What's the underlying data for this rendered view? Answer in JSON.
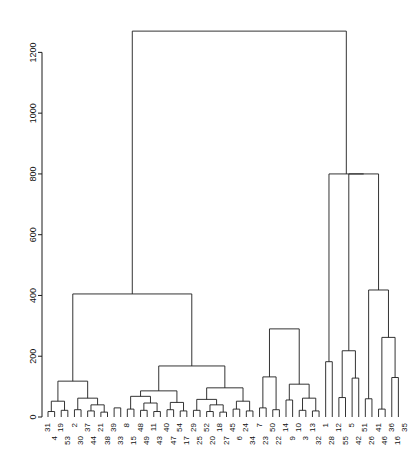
{
  "chart_data": {
    "type": "dendrogram",
    "title": "",
    "subtitle": "",
    "xlabel": "",
    "ylabel": "",
    "ylim": [
      0,
      1300
    ],
    "yticks": [
      0,
      200,
      400,
      600,
      800,
      1000,
      1200
    ],
    "ytick_labels": [
      "0",
      "200",
      "400",
      "600",
      "800",
      "1000",
      "1200"
    ],
    "grid": false,
    "legend": "none",
    "axis_side": "left",
    "leaf_label_rotation": -90,
    "leaf_label_stagger": true,
    "n_leaves": 55,
    "leaf_labels": [
      "31",
      "4",
      "19",
      "53",
      "2",
      "30",
      "37",
      "44",
      "21",
      "38",
      "39",
      "33",
      "8",
      "15",
      "48",
      "49",
      "11",
      "43",
      "40",
      "47",
      "54",
      "17",
      "29",
      "25",
      "52",
      "20",
      "18",
      "27",
      "45",
      "6",
      "24",
      "34",
      "7",
      "23",
      "50",
      "22",
      "14",
      "9",
      "10",
      "3",
      "13",
      "32",
      "1",
      "28",
      "12",
      "55",
      "5",
      "42",
      "51",
      "26",
      "41",
      "46",
      "36",
      "16",
      "35"
    ],
    "merges": [
      {
        "id": "m1",
        "left": "31",
        "right": "4",
        "height": 18
      },
      {
        "id": "m2",
        "left": "19",
        "right": "53",
        "height": 22
      },
      {
        "id": "m3",
        "left": "m1",
        "right": "m2",
        "height": 52
      },
      {
        "id": "m4",
        "left": "2",
        "right": "30",
        "height": 24
      },
      {
        "id": "m5",
        "left": "37",
        "right": "44",
        "height": 20
      },
      {
        "id": "m6",
        "left": "21",
        "right": "38",
        "height": 16
      },
      {
        "id": "m7",
        "left": "m5",
        "right": "m6",
        "height": 40
      },
      {
        "id": "m8",
        "left": "m4",
        "right": "m7",
        "height": 62
      },
      {
        "id": "m9",
        "left": "m3",
        "right": "m8",
        "height": 118
      },
      {
        "id": "m10",
        "left": "39",
        "right": "33",
        "height": 30
      },
      {
        "id": "m11",
        "left": "8",
        "right": "15",
        "height": 26
      },
      {
        "id": "m12",
        "left": "48",
        "right": "49",
        "height": 22
      },
      {
        "id": "m13",
        "left": "11",
        "right": "43",
        "height": 18
      },
      {
        "id": "m14",
        "left": "m12",
        "right": "m13",
        "height": 46
      },
      {
        "id": "m15",
        "left": "m11",
        "right": "m14",
        "height": 68
      },
      {
        "id": "m16",
        "left": "40",
        "right": "47",
        "height": 24
      },
      {
        "id": "m17",
        "left": "54",
        "right": "17",
        "height": 20
      },
      {
        "id": "m18",
        "left": "m16",
        "right": "m17",
        "height": 48
      },
      {
        "id": "m19",
        "left": "m15",
        "right": "m18",
        "height": 86
      },
      {
        "id": "m20",
        "left": "29",
        "right": "25",
        "height": 22
      },
      {
        "id": "m21",
        "left": "52",
        "right": "20",
        "height": 18
      },
      {
        "id": "m22",
        "left": "18",
        "right": "27",
        "height": 16
      },
      {
        "id": "m23",
        "left": "m21",
        "right": "m22",
        "height": 40
      },
      {
        "id": "m24",
        "left": "m20",
        "right": "m23",
        "height": 58
      },
      {
        "id": "m25",
        "left": "45",
        "right": "6",
        "height": 26
      },
      {
        "id": "m26",
        "left": "24",
        "right": "34",
        "height": 20
      },
      {
        "id": "m27",
        "left": "m25",
        "right": "m26",
        "height": 52
      },
      {
        "id": "m28",
        "left": "m24",
        "right": "m27",
        "height": 96
      },
      {
        "id": "m29",
        "left": "m19",
        "right": "m28",
        "height": 168
      },
      {
        "id": "m30",
        "left": "m9",
        "right": "m29",
        "height": 405
      },
      {
        "id": "m31",
        "left": "7",
        "right": "23",
        "height": 30
      },
      {
        "id": "m32",
        "left": "50",
        "right": "22",
        "height": 24
      },
      {
        "id": "m33",
        "left": "m31",
        "right": "m32",
        "height": 132
      },
      {
        "id": "m34",
        "left": "14",
        "right": "9",
        "height": 56
      },
      {
        "id": "m35",
        "left": "10",
        "right": "3",
        "height": 22
      },
      {
        "id": "m36",
        "left": "13",
        "right": "32",
        "height": 20
      },
      {
        "id": "m37",
        "left": "m35",
        "right": "m36",
        "height": 62
      },
      {
        "id": "m38",
        "left": "m34",
        "right": "m37",
        "height": 108
      },
      {
        "id": "m39",
        "left": "m33",
        "right": "m38",
        "height": 290
      },
      {
        "id": "m40",
        "left": "1",
        "right": "28",
        "height": 182
      },
      {
        "id": "m41",
        "left": "12",
        "right": "55",
        "height": 64
      },
      {
        "id": "m42",
        "left": "5",
        "right": "42",
        "height": 128
      },
      {
        "id": "m43",
        "left": "m41",
        "right": "m42",
        "height": 218
      },
      {
        "id": "m44",
        "left": "51",
        "right": "26",
        "height": 60
      },
      {
        "id": "m45",
        "left": "41",
        "right": "46",
        "height": 26
      },
      {
        "id": "m46",
        "left": "36",
        "right": "16",
        "height": 130
      },
      {
        "id": "m47",
        "left": "m45",
        "right": "m46",
        "height": 262
      },
      {
        "id": "m48",
        "left": "m44",
        "right": "m47",
        "height": 418
      },
      {
        "id": "m49",
        "left": "m43",
        "right": "m48",
        "height": 800
      },
      {
        "id": "m50",
        "left": "m40",
        "right": "m49",
        "height": 800
      },
      {
        "id": "m51",
        "left": "m30",
        "right": "m50",
        "height": 1270
      }
    ],
    "root_height": 1270
  }
}
